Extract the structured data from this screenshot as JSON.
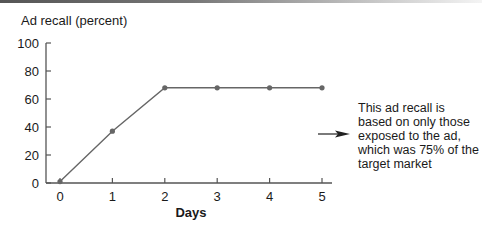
{
  "chart_data": {
    "type": "line",
    "title": "",
    "ylabel": "Ad recall (percent)",
    "xlabel": "Days",
    "x": [
      0,
      1,
      2,
      3,
      4,
      5
    ],
    "series": [
      {
        "name": "Ad recall",
        "values": [
          1,
          37,
          68,
          68,
          68,
          68
        ]
      }
    ],
    "xticks": [
      "0",
      "1",
      "2",
      "3",
      "4",
      "5"
    ],
    "yticks": [
      "0",
      "20",
      "40",
      "60",
      "80",
      "100"
    ],
    "ylim": [
      0,
      100
    ],
    "xlim": [
      0,
      5
    ],
    "grid": false,
    "annotations": [
      {
        "text": "This ad recall is based on only those exposed to the ad, which was 75% of the target market",
        "arrow": "points left toward the plateau"
      }
    ]
  },
  "labels": {
    "ylabel": "Ad recall (percent)",
    "xlabel": "Days",
    "note": "This ad recall is based on only those exposed to the ad, which was 75% of the target market"
  }
}
